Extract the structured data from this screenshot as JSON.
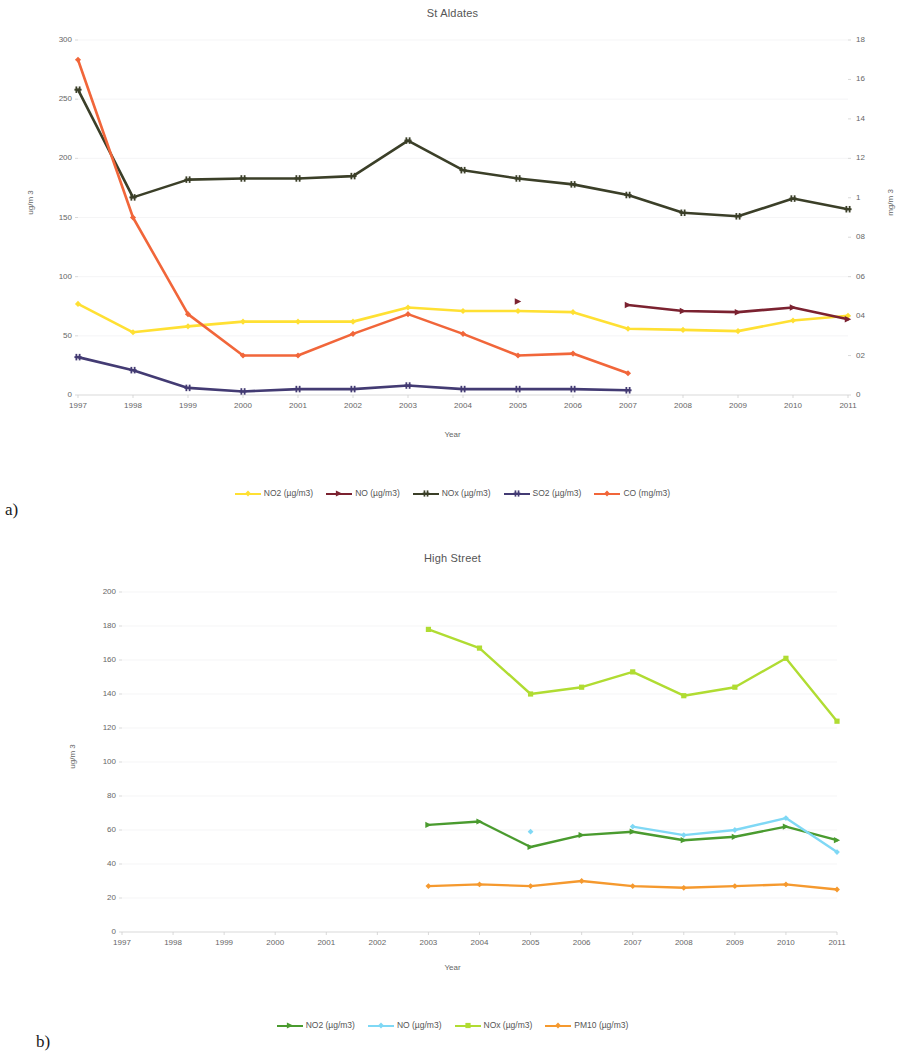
{
  "figures": [
    {
      "panel_label": "a)",
      "title": "St Aldates",
      "xlabel": "Year",
      "ylabel_left": "ug/m 3",
      "ylabel_right": "mg/m 3"
    },
    {
      "panel_label": "b)",
      "title": "High Street",
      "xlabel": "Year",
      "ylabel_left": "ug/m 3"
    }
  ],
  "chart_data": [
    {
      "type": "line",
      "title": "St Aldates",
      "xlabel": "Year",
      "ylabel": "ug/m 3",
      "ylabel_secondary": "mg/m 3",
      "grid": true,
      "legend_position": "bottom",
      "x": [
        1997,
        1998,
        1999,
        2000,
        2001,
        2002,
        2003,
        2004,
        2005,
        2006,
        2007,
        2008,
        2009,
        2010,
        2011
      ],
      "xticklabels": [
        "1997",
        "1998",
        "1999",
        "2000",
        "2001",
        "2002",
        "2003",
        "2004",
        "2005",
        "2006",
        "2007",
        "2008",
        "2009",
        "2010",
        "2011"
      ],
      "ylim": [
        0,
        300
      ],
      "yticks": [
        0,
        50,
        100,
        150,
        200,
        250,
        300
      ],
      "yticklabels": [
        "0",
        "50",
        "100",
        "150",
        "200",
        "250",
        "300"
      ],
      "ylim_secondary": [
        0,
        1.8
      ],
      "yticks_secondary": [
        0,
        0.2,
        0.4,
        0.6,
        0.8,
        1.0,
        1.2,
        1.4,
        1.6,
        1.8
      ],
      "yticklabels_secondary": [
        "0",
        "02",
        "04",
        "06",
        "08",
        "1",
        "12",
        "14",
        "16",
        "18"
      ],
      "series": [
        {
          "name": "NO2 (µg/m3)",
          "color": "#ffe033",
          "axis": "left",
          "marker": "diamond",
          "values": [
            77,
            53,
            58,
            62,
            62,
            62,
            74,
            71,
            71,
            70,
            56,
            55,
            54,
            63,
            67
          ]
        },
        {
          "name": "NO (µg/m3)",
          "color": "#7b2230",
          "axis": "left",
          "marker": "triangle",
          "values": [
            null,
            null,
            null,
            null,
            null,
            null,
            null,
            null,
            79,
            null,
            76,
            71,
            70,
            74,
            64
          ]
        },
        {
          "name": "NOx (µg/m3)",
          "color": "#3b3f28",
          "axis": "left",
          "marker": "cross",
          "values": [
            258,
            167,
            182,
            183,
            183,
            185,
            215,
            190,
            183,
            178,
            169,
            154,
            151,
            166,
            157
          ]
        },
        {
          "name": "SO2 (µg/m3)",
          "color": "#433b73",
          "axis": "left",
          "marker": "cross",
          "values": [
            32,
            21,
            6,
            3,
            5,
            5,
            8,
            5,
            5,
            5,
            4,
            null,
            null,
            null,
            null
          ]
        },
        {
          "name": "CO (mg/m3)",
          "color": "#f1663a",
          "axis": "right",
          "marker": "diamond",
          "values": [
            1.7,
            0.9,
            0.41,
            0.2,
            0.2,
            0.31,
            0.41,
            0.31,
            0.2,
            0.21,
            0.11,
            null,
            null,
            null,
            null
          ]
        }
      ]
    },
    {
      "type": "line",
      "title": "High Street",
      "xlabel": "Year",
      "ylabel": "ug/m 3",
      "grid": true,
      "legend_position": "bottom",
      "x": [
        1997,
        1998,
        1999,
        2000,
        2001,
        2002,
        2003,
        2004,
        2005,
        2006,
        2007,
        2008,
        2009,
        2010,
        2011
      ],
      "xticklabels": [
        "1997",
        "1998",
        "1999",
        "2000",
        "2001",
        "2002",
        "2003",
        "2004",
        "2005",
        "2006",
        "2007",
        "2008",
        "2009",
        "2010",
        "2011"
      ],
      "ylim": [
        0,
        200
      ],
      "yticks": [
        0,
        20,
        40,
        60,
        80,
        100,
        120,
        140,
        160,
        180,
        200
      ],
      "yticklabels": [
        "0",
        "20",
        "40",
        "60",
        "80",
        "100",
        "120",
        "140",
        "160",
        "180",
        "200"
      ],
      "series": [
        {
          "name": "NO2 (µg/m3)",
          "color": "#4a9b2f",
          "axis": "left",
          "marker": "triangle",
          "values": [
            null,
            null,
            null,
            null,
            null,
            null,
            63,
            65,
            50,
            57,
            59,
            54,
            56,
            62,
            54
          ]
        },
        {
          "name": "NO (µg/m3)",
          "color": "#7fd8f5",
          "axis": "left",
          "marker": "diamond",
          "values": [
            null,
            null,
            null,
            null,
            null,
            null,
            null,
            null,
            59,
            null,
            62,
            57,
            60,
            67,
            47
          ]
        },
        {
          "name": "NOx (µg/m3)",
          "color": "#b0dc32",
          "axis": "left",
          "marker": "square",
          "values": [
            null,
            null,
            null,
            null,
            null,
            null,
            178,
            167,
            140,
            144,
            153,
            139,
            144,
            161,
            124
          ]
        },
        {
          "name": "PM10 (µg/m3)",
          "color": "#f5992e",
          "axis": "left",
          "marker": "diamond",
          "values": [
            null,
            null,
            null,
            null,
            null,
            null,
            27,
            28,
            27,
            30,
            27,
            26,
            27,
            28,
            25
          ]
        }
      ]
    }
  ]
}
